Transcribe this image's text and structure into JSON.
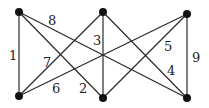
{
  "graph": {
    "type": "complete-bipartite-K3,3",
    "nodes": [
      {
        "id": "TL",
        "x": 19,
        "y": 12
      },
      {
        "id": "TM",
        "x": 103,
        "y": 12
      },
      {
        "id": "TR",
        "x": 187,
        "y": 14
      },
      {
        "id": "BL",
        "x": 19,
        "y": 96
      },
      {
        "id": "BM",
        "x": 103,
        "y": 98
      },
      {
        "id": "BR",
        "x": 187,
        "y": 98
      }
    ],
    "edges": [
      {
        "from": "TL",
        "to": "BL",
        "label": "1",
        "lx": 9,
        "ly": 60
      },
      {
        "from": "TL",
        "to": "BM",
        "label": "2",
        "lx": 79,
        "ly": 93
      },
      {
        "from": "TM",
        "to": "BM",
        "label": "3",
        "lx": 93,
        "ly": 45
      },
      {
        "from": "TM",
        "to": "BR",
        "label": "4",
        "lx": 167,
        "ly": 75
      },
      {
        "from": "TR",
        "to": "BM",
        "label": "5",
        "lx": 164,
        "ly": 51
      },
      {
        "from": "TR",
        "to": "BL",
        "label": "6",
        "lx": 52,
        "ly": 93
      },
      {
        "from": "TM",
        "to": "BL",
        "label": "7",
        "lx": 43,
        "ly": 67
      },
      {
        "from": "TL",
        "to": "BR",
        "label": "8",
        "lx": 48,
        "ly": 25
      },
      {
        "from": "TR",
        "to": "BR",
        "label": "9",
        "lx": 192,
        "ly": 62
      }
    ]
  },
  "labels": {
    "e1": "1",
    "e2": "2",
    "e3": "3",
    "e4": "4",
    "e5": "5",
    "e6": "6",
    "e7": "7",
    "e8": "8",
    "e9": "9"
  }
}
